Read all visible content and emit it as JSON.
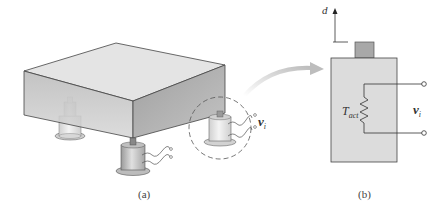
{
  "figure": {
    "panel_a": {
      "caption": "(a)",
      "description": "Platform/block supported by four load-cell transducers",
      "voltage_label": {
        "symbol": "v",
        "subscript": "i"
      }
    },
    "panel_b": {
      "caption": "(b)",
      "displacement_label": "d",
      "resistor_label": {
        "symbol": "T",
        "subscript": "act"
      },
      "voltage_label": {
        "symbol": "v",
        "subscript": "i"
      }
    },
    "colors": {
      "block_top": "#e6e6e6",
      "block_front": "#bdbdbd",
      "block_side": "#a9a9a9",
      "sensor_body": "#c8c8c8",
      "panel_b_box": "#dcdcdc",
      "panel_b_plunger": "#a8a8a8",
      "arrow": "#c9c9c9",
      "line": "#444444"
    }
  }
}
